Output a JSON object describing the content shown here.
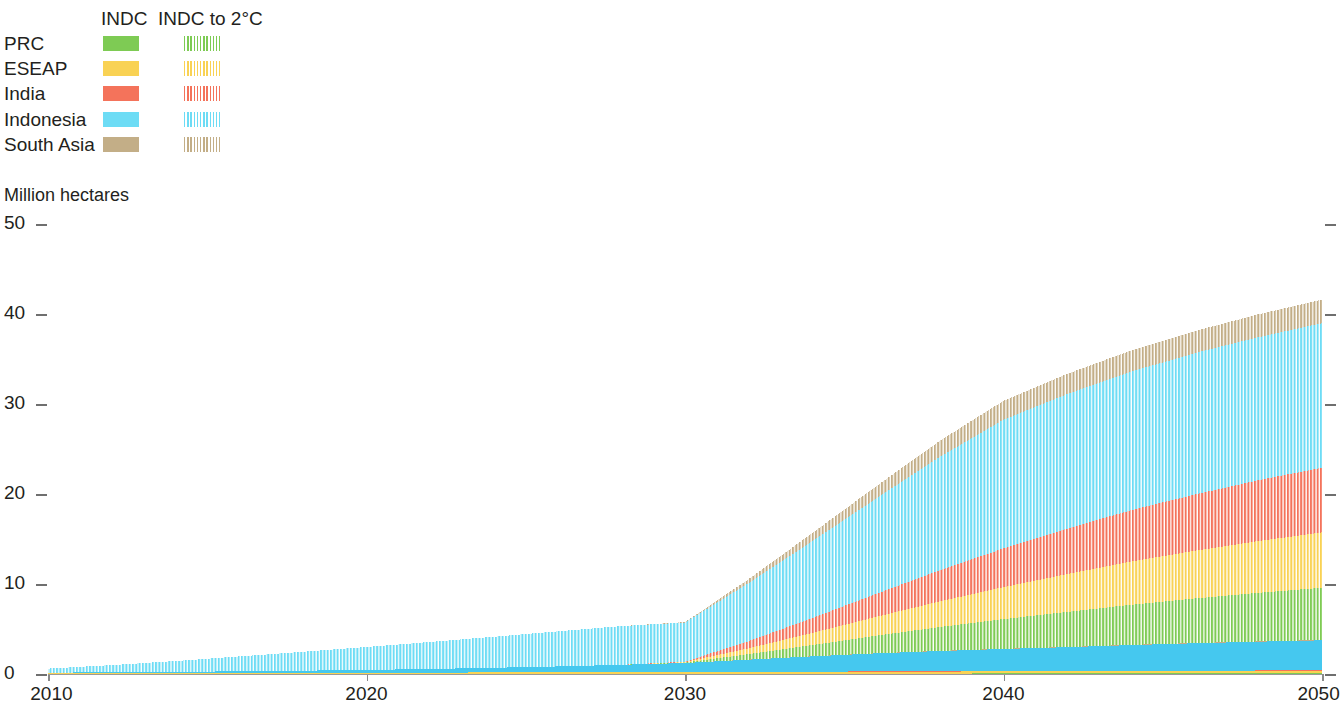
{
  "legend": {
    "headers": [
      "INDC",
      "INDC to 2°C"
    ],
    "rows": [
      {
        "label": "PRC",
        "color": "#7ecb54"
      },
      {
        "label": "ESEAP",
        "color": "#f9d254"
      },
      {
        "label": "India",
        "color": "#f4735b"
      },
      {
        "label": "Indonesia",
        "color": "#6ddcf5"
      },
      {
        "label": "South Asia",
        "color": "#c3ae87"
      }
    ]
  },
  "chart_data": {
    "type": "area",
    "title": "",
    "subtitle": "",
    "xlabel": "",
    "ylabel": "Million hectares",
    "xlim": [
      2010,
      2050
    ],
    "ylim": [
      0,
      50
    ],
    "xticks": [
      2010,
      2020,
      2030,
      2040,
      2050
    ],
    "yticks": [
      0,
      10,
      20,
      30,
      40,
      50
    ],
    "grid": false,
    "legend_position": "top-left",
    "stacked": true,
    "x": [
      2010,
      2012,
      2014,
      2016,
      2018,
      2020,
      2022,
      2024,
      2026,
      2028,
      2030,
      2032,
      2034,
      2036,
      2038,
      2040,
      2042,
      2044,
      2046,
      2048,
      2050
    ],
    "scenarios": [
      {
        "name": "INDC",
        "style": "solid",
        "series": [
          {
            "name": "PRC",
            "color": "#7ecb54",
            "values": [
              0.0,
              0.0,
              0.0,
              0.0,
              0.0,
              0.0,
              0.0,
              0.0,
              0.0,
              0.0,
              0.01,
              0.02,
              0.03,
              0.04,
              0.05,
              0.06,
              0.06,
              0.07,
              0.07,
              0.08,
              0.08
            ]
          },
          {
            "name": "ESEAP",
            "color": "#f9d254",
            "values": [
              0.1,
              0.11,
              0.12,
              0.13,
              0.14,
              0.15,
              0.16,
              0.17,
              0.18,
              0.19,
              0.2,
              0.2,
              0.21,
              0.22,
              0.22,
              0.23,
              0.23,
              0.24,
              0.24,
              0.25,
              0.25
            ]
          },
          {
            "name": "India",
            "color": "#f4735b",
            "values": [
              0.0,
              0.0,
              0.0,
              0.0,
              0.0,
              0.0,
              0.0,
              0.0,
              0.0,
              0.01,
              0.01,
              0.02,
              0.02,
              0.03,
              0.03,
              0.04,
              0.04,
              0.05,
              0.05,
              0.06,
              0.06
            ]
          },
          {
            "name": "Indonesia",
            "color": "#45c8ef",
            "values": [
              0.05,
              0.08,
              0.12,
              0.17,
              0.23,
              0.3,
              0.4,
              0.52,
              0.66,
              0.82,
              1.0,
              1.35,
              1.7,
              2.0,
              2.25,
              2.45,
              2.65,
              2.85,
              3.05,
              3.2,
              3.35
            ]
          },
          {
            "name": "South Asia",
            "color": "#c3ae87",
            "values": [
              0.0,
              0.0,
              0.0,
              0.0,
              0.0,
              0.0,
              0.0,
              0.0,
              0.0,
              0.0,
              0.0,
              0.01,
              0.01,
              0.01,
              0.02,
              0.02,
              0.02,
              0.03,
              0.03,
              0.03,
              0.04
            ]
          }
        ]
      },
      {
        "name": "INDC to 2°C",
        "style": "hatched",
        "series": [
          {
            "name": "PRC",
            "color": "#7ecb54",
            "values": [
              0.0,
              0.0,
              0.0,
              0.0,
              0.0,
              0.0,
              0.0,
              0.0,
              0.0,
              0.0,
              0.05,
              0.6,
              1.25,
              1.95,
              2.65,
              3.3,
              3.9,
              4.45,
              4.95,
              5.4,
              5.8
            ]
          },
          {
            "name": "ESEAP",
            "color": "#f9d254",
            "values": [
              0.0,
              0.0,
              0.0,
              0.0,
              0.0,
              0.0,
              0.0,
              0.0,
              0.0,
              0.0,
              0.05,
              0.65,
              1.35,
              2.1,
              2.85,
              3.55,
              4.2,
              4.8,
              5.3,
              5.75,
              6.15
            ]
          },
          {
            "name": "India",
            "color": "#f4735b",
            "values": [
              0.0,
              0.0,
              0.0,
              0.0,
              0.0,
              0.0,
              0.0,
              0.0,
              0.0,
              0.0,
              0.05,
              0.8,
              1.65,
              2.55,
              3.45,
              4.3,
              5.05,
              5.7,
              6.25,
              6.75,
              7.2
            ]
          },
          {
            "name": "Indonesia",
            "color": "#6ddcf5",
            "values": [
              0.45,
              0.8,
              1.2,
              1.65,
              2.1,
              2.55,
              3.0,
              3.45,
              3.9,
              4.3,
              4.35,
              6.45,
              8.55,
              10.6,
              12.6,
              14.3,
              14.95,
              15.4,
              15.7,
              15.9,
              16.05
            ]
          },
          {
            "name": "South Asia",
            "color": "#c3ae87",
            "values": [
              0.0,
              0.0,
              0.0,
              0.0,
              0.0,
              0.0,
              0.0,
              0.0,
              0.0,
              0.0,
              0.05,
              0.45,
              0.9,
              1.35,
              1.8,
              2.1,
              2.25,
              2.35,
              2.45,
              2.55,
              2.62
            ]
          }
        ]
      }
    ],
    "totals": [
      0.6,
      0.99,
      1.44,
      1.95,
      2.47,
      3.0,
      3.56,
      4.14,
      4.74,
      5.32,
      5.77,
      10.55,
      15.67,
      20.85,
      25.92,
      30.35,
      33.35,
      35.74,
      37.59,
      39.07,
      41.6
    ]
  }
}
